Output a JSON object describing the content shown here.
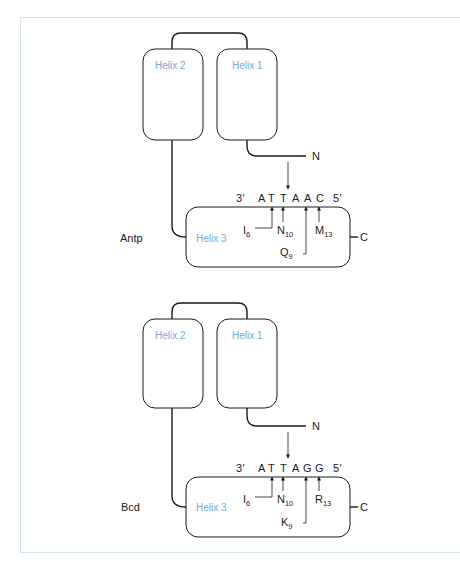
{
  "colors": {
    "helix_label": "#7aa7d6",
    "frame_border": "#cfe3ee",
    "ink": "#1a1a1a"
  },
  "panels": [
    {
      "protein": "Antp",
      "helix1": "Helix 1",
      "helix2": "Helix 2",
      "helix3": "Helix 3",
      "n_terminus": "N",
      "c_terminus": "C",
      "dna": {
        "end3": "3′",
        "bases": [
          "A",
          "T",
          "T",
          "A",
          "A",
          "C"
        ],
        "end5": "5′"
      },
      "residues": [
        {
          "aa": "I",
          "pos": "6",
          "contacts_base_index": 1
        },
        {
          "aa": "N",
          "pos": "10",
          "contacts_base_index": 2
        },
        {
          "aa": "Q",
          "pos": "9",
          "contacts_base_index": 4
        },
        {
          "aa": "M",
          "pos": "13",
          "contacts_base_index": 5
        }
      ]
    },
    {
      "protein": "Bcd",
      "helix1": "Helix 1",
      "helix2": "Helix 2",
      "helix3": "Helix 3",
      "n_terminus": "N",
      "c_terminus": "C",
      "dna": {
        "end3": "3′",
        "bases": [
          "A",
          "T",
          "T",
          "A",
          "G",
          "G"
        ],
        "end5": "5′"
      },
      "residues": [
        {
          "aa": "I",
          "pos": "6",
          "contacts_base_index": 1
        },
        {
          "aa": "N",
          "pos": "10",
          "contacts_base_index": 2
        },
        {
          "aa": "K",
          "pos": "9",
          "contacts_base_index": 4
        },
        {
          "aa": "R",
          "pos": "13",
          "contacts_base_index": 5
        }
      ]
    }
  ]
}
